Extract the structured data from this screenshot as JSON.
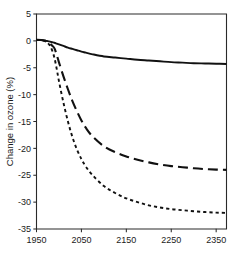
{
  "chart_data": {
    "type": "line",
    "title": "",
    "subtitle": "",
    "xlabel": "",
    "ylabel": "Change in ozone (%)",
    "xlim": [
      1950,
      2373
    ],
    "ylim": [
      -35,
      5
    ],
    "xticks": [
      1950,
      2050,
      2150,
      2250,
      2350
    ],
    "xticklabels": [
      "1950",
      "2050",
      "2150",
      "2250",
      "2350"
    ],
    "yticks": [
      5,
      0,
      -5,
      -10,
      -15,
      -20,
      -25,
      -30,
      -35
    ],
    "yticklabels": [
      "5",
      "0",
      "-5",
      "-10",
      "-15",
      "-20",
      "-25",
      "-30",
      "-35"
    ],
    "grid": false,
    "legend": "none",
    "colors": {
      "line": "#111111",
      "axis": "#2a2a2a",
      "background": "#ffffff"
    },
    "x": [
      1950,
      1960,
      1970,
      1975,
      1980,
      1985,
      1990,
      1995,
      2000,
      2010,
      2020,
      2030,
      2040,
      2050,
      2060,
      2075,
      2100,
      2125,
      2150,
      2175,
      2200,
      2225,
      2250,
      2275,
      2300,
      2325,
      2350,
      2373
    ],
    "series": [
      {
        "name": "solid",
        "style": "solid",
        "dasharray": "none",
        "values": [
          0.2,
          0.15,
          0.05,
          -0.05,
          -0.15,
          -0.25,
          -0.35,
          -0.5,
          -0.65,
          -0.95,
          -1.25,
          -1.5,
          -1.75,
          -2.0,
          -2.2,
          -2.5,
          -2.9,
          -3.1,
          -3.3,
          -3.5,
          -3.65,
          -3.8,
          -3.95,
          -4.05,
          -4.15,
          -4.2,
          -4.25,
          -4.3
        ]
      },
      {
        "name": "long-dash",
        "style": "long-dashed",
        "dasharray": "10 5",
        "values": [
          0.2,
          0.15,
          0.0,
          -0.2,
          -0.5,
          -0.9,
          -1.4,
          -2.6,
          -4.0,
          -6.6,
          -9.0,
          -11.2,
          -13.1,
          -14.8,
          -16.2,
          -17.8,
          -19.6,
          -20.7,
          -21.5,
          -22.1,
          -22.6,
          -23.0,
          -23.3,
          -23.5,
          -23.7,
          -23.85,
          -23.95,
          -24.0
        ]
      },
      {
        "name": "short-dash",
        "style": "short-dashed",
        "dasharray": "3.2 3",
        "values": [
          0.2,
          0.1,
          -0.1,
          -0.4,
          -0.9,
          -1.8,
          -3.2,
          -5.2,
          -7.5,
          -11.5,
          -15.0,
          -17.9,
          -20.2,
          -22.0,
          -23.4,
          -25.0,
          -27.0,
          -28.3,
          -29.3,
          -30.0,
          -30.6,
          -31.0,
          -31.3,
          -31.5,
          -31.7,
          -31.85,
          -31.95,
          -32.0
        ]
      }
    ]
  }
}
